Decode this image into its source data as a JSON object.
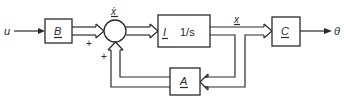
{
  "diagram": {
    "type": "state-space block diagram",
    "input": {
      "label": "u"
    },
    "output": {
      "label": "θ"
    },
    "blocks": [
      {
        "id": "B",
        "label": "B"
      },
      {
        "id": "I",
        "label": "I",
        "transfer": "1/s"
      },
      {
        "id": "C",
        "label": "C"
      },
      {
        "id": "A",
        "label": "A"
      }
    ],
    "summing_junction": {
      "signs": [
        "+",
        "+"
      ],
      "output_label": "ẋ"
    },
    "signals": {
      "state": "x",
      "state_derivative": "ẋ"
    }
  }
}
